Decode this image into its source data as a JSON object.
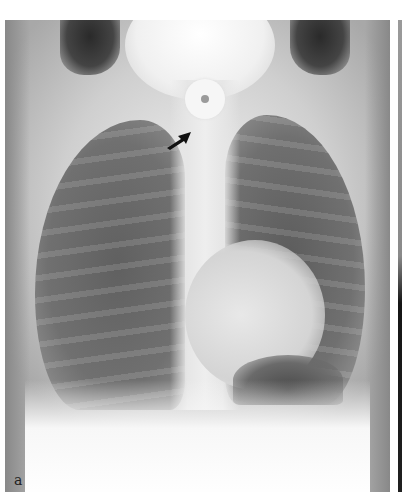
{
  "figure": {
    "panel_label": "a",
    "annotations": [
      {
        "type": "arrow",
        "icon": "arrow-icon",
        "color": "#111111",
        "points_to": "foreign-body"
      }
    ],
    "colors": {
      "background": "#ffffff",
      "label_text": "#222222"
    }
  }
}
